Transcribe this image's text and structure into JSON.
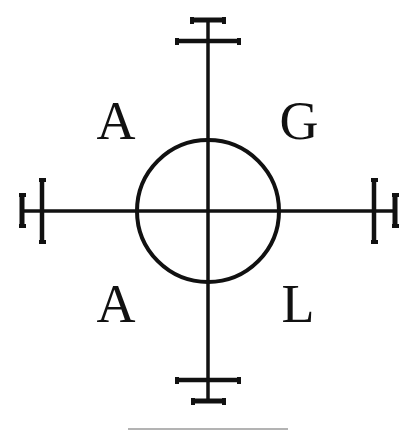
{
  "diagram": {
    "letters": {
      "top_left": "A",
      "top_right": "G",
      "bottom_left": "A",
      "bottom_right": "L"
    },
    "colors": {
      "ink": "#111111",
      "background": "#ffffff",
      "rule": "#9a9a9a"
    }
  }
}
